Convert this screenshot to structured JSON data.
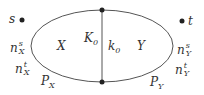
{
  "diagram": {
    "points": {
      "s": "s",
      "t": "t"
    },
    "regions": {
      "left": "X",
      "right": "Y"
    },
    "divider": {
      "left_label": "K",
      "left_sub": "0",
      "right_label": "k",
      "right_sub": "0"
    },
    "left_labels": {
      "ns_base": "n",
      "ns_sup": "s",
      "ns_sub": "X",
      "nt_base": "n",
      "nt_sup": "t",
      "nt_sub": "X",
      "p_base": "P",
      "p_sub": "X"
    },
    "right_labels": {
      "ns_base": "n",
      "ns_sup": "s",
      "ns_sub": "Y",
      "nt_base": "n",
      "nt_sup": "t",
      "nt_sub": "Y",
      "p_base": "P",
      "p_sub": "Y"
    }
  }
}
